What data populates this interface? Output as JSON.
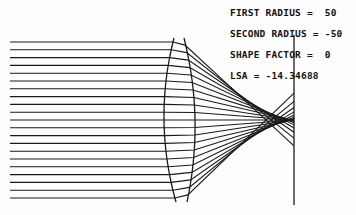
{
  "params": {
    "first_radius": "FIRST RADIUS =  50",
    "second_radius": "SECOND RADIUS = -50",
    "shape_factor": "SHAPE FACTOR =  0",
    "lsa": "LSA = -14.34688"
  },
  "colors": {
    "ink": "#1a1a1a",
    "background": "#fefefe"
  },
  "geometry": {
    "axis_y": 120,
    "ray_start_x": 10,
    "ray_top_y": 42,
    "ray_bottom_y": 198,
    "ray_count": 21,
    "lens_front": {
      "top": [
        174,
        38
      ],
      "mid": [
        164,
        120
      ],
      "bottom": [
        176,
        202
      ]
    },
    "lens_back": {
      "top": [
        184,
        38
      ],
      "mid": [
        195,
        120
      ],
      "bottom": [
        187,
        202
      ]
    },
    "image_plane": {
      "x": 294,
      "y1": 35,
      "y2": 205
    },
    "paraxial_focus_x": 294,
    "marginal_focus_x": 266
  }
}
